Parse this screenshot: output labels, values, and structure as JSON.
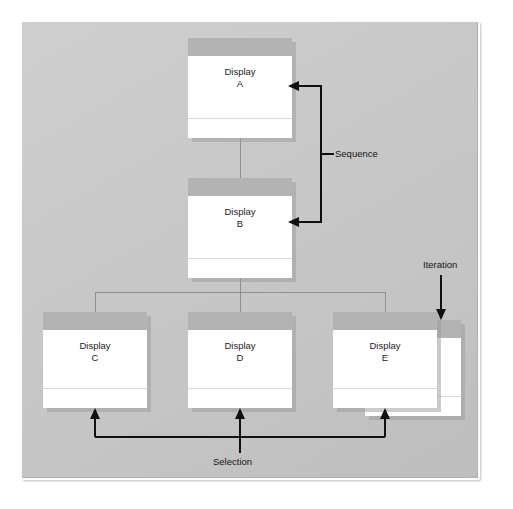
{
  "diagram": {
    "type": "jackson-structure-chart",
    "background_color": "#ffffff",
    "panel_color": "#c8c8c8",
    "box_title_color": "#b3b3b3",
    "box_body_color": "#ffffff",
    "connector_color": "#8f8f8f",
    "annotation_color": "#101010",
    "nodes": [
      {
        "id": "A",
        "title": "Display",
        "sub": "A",
        "label": "Display\nA",
        "level": 1
      },
      {
        "id": "B",
        "title": "Display",
        "sub": "B",
        "label": "Display\nB",
        "level": 2
      },
      {
        "id": "C",
        "title": "Display",
        "sub": "C",
        "label": "Display\nC",
        "level": 3
      },
      {
        "id": "D",
        "title": "Display",
        "sub": "D",
        "label": "Display\nD",
        "level": 3
      },
      {
        "id": "E",
        "title": "Display",
        "sub": "E",
        "label": "Display\nE",
        "level": 3,
        "stacked": true
      }
    ],
    "annotations": [
      {
        "id": "sequence",
        "label": "Sequence",
        "kind": "bracket-left",
        "targets": [
          "A",
          "B"
        ]
      },
      {
        "id": "selection",
        "label": "Selection",
        "kind": "bracket-up",
        "targets": [
          "C",
          "D",
          "E"
        ]
      },
      {
        "id": "iteration",
        "label": "Iteration",
        "kind": "arrow-down",
        "targets": [
          "E"
        ]
      }
    ]
  }
}
